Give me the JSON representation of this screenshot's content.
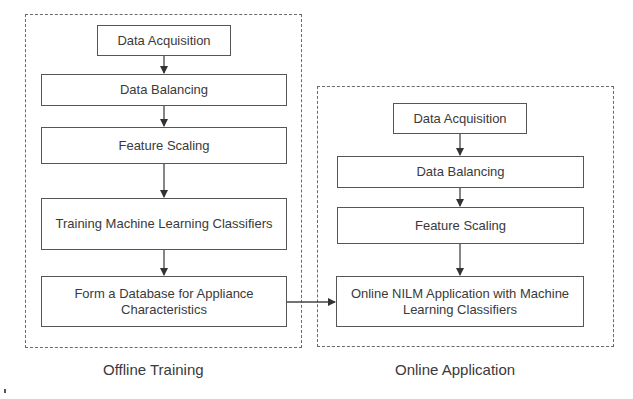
{
  "offline": {
    "title": "Offline Training",
    "steps": [
      "Data Acquisition",
      "Data Balancing",
      "Feature Scaling",
      "Training Machine Learning Classifiers",
      "Form a Database for Appliance Characteristics"
    ]
  },
  "online": {
    "title": "Online Application",
    "steps": [
      "Data Acquisition",
      "Data Balancing",
      "Feature Scaling",
      "Online NILM Application with Machine Learning Classifiers"
    ]
  },
  "connections": [
    {
      "from": "offline.steps.4",
      "to": "online.steps.3"
    }
  ]
}
